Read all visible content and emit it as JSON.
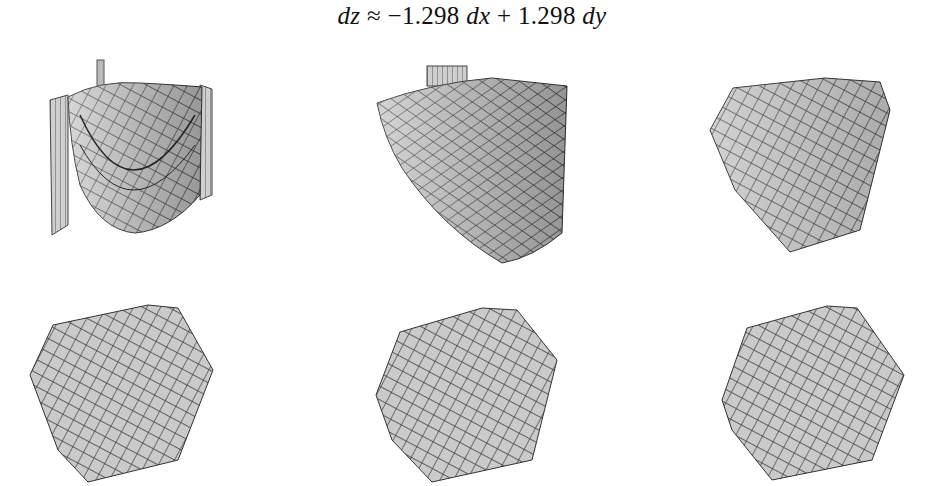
{
  "figure": {
    "equation": {
      "lhs": "dz",
      "relation": "≈",
      "coef_dx": "−1.298",
      "var_dx": "dx",
      "op": "+",
      "coef_dy": "1.298",
      "var_dy": "dy"
    },
    "panels": [
      {
        "id": "panel-1",
        "description": "Curved paraboloid-like surface with vertical walls, zoomed out"
      },
      {
        "id": "panel-2",
        "description": "Curved surface section, moderately zoomed"
      },
      {
        "id": "panel-3",
        "description": "Nearly flat surface patch, further zoomed"
      },
      {
        "id": "panel-4",
        "description": "Flat hexagonal-outline surface patch (near-planar)"
      },
      {
        "id": "panel-5",
        "description": "Flat hexagonal-outline surface patch (near-planar)"
      },
      {
        "id": "panel-6",
        "description": "Flat hexagonal-outline surface patch (near-planar)"
      }
    ],
    "colors": {
      "surface_fill": "#c9c9c9",
      "surface_dark": "#9a9a9a",
      "mesh_line": "#3a3a3a",
      "background": "#ffffff"
    }
  }
}
